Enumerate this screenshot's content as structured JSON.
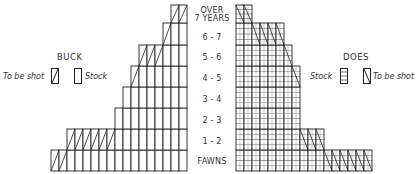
{
  "chart_data": {
    "type": "bar",
    "subtype": "population-pyramid",
    "title": "",
    "categories": [
      "FAWNS",
      "1 - 2",
      "2 - 3",
      "3 - 4",
      "4 - 5",
      "5 - 6",
      "6 - 7",
      "OVER 7 YEARS"
    ],
    "units": "cells (individual animals)",
    "series": [
      {
        "name": "BUCK - Stock",
        "side": "left",
        "values": [
          15,
          9,
          9,
          8,
          6,
          3,
          2,
          0
        ]
      },
      {
        "name": "BUCK - To be shot",
        "side": "left",
        "values": [
          2,
          6,
          0,
          0,
          1,
          3,
          1,
          2
        ]
      },
      {
        "name": "DOES - Stock",
        "side": "right",
        "values": [
          11,
          8,
          8,
          8,
          7,
          6,
          2,
          0
        ]
      },
      {
        "name": "DOES - To be shot",
        "side": "right",
        "values": [
          6,
          3,
          0,
          0,
          1,
          1,
          4,
          2
        ]
      }
    ],
    "legend": {
      "buck": {
        "title": "BUCK",
        "entries": [
          "To be shot",
          "Stock"
        ]
      },
      "does": {
        "title": "DOES",
        "entries": [
          "Stock",
          "To be shot"
        ]
      }
    },
    "grid": true
  },
  "labels": {
    "ages": [
      "OVER",
      "7 YEARS",
      "6 - 7",
      "5 - 6",
      "4 - 5",
      "3 - 4",
      "2 - 3",
      "1 - 2",
      "FAWNS"
    ],
    "buck_title": "BUCK",
    "does_title": "DOES",
    "to_be_shot": "To be shot",
    "stock": "Stock"
  }
}
